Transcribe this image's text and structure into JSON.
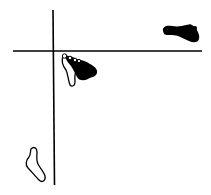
{
  "diagram": {
    "type": "footprints-at-crossroads",
    "lines": [
      {
        "name": "vertical-line",
        "x1": 53,
        "y1": 10,
        "x2": 54,
        "y2": 185
      },
      {
        "name": "horizontal-line",
        "x1": 13,
        "y1": 51,
        "x2": 202,
        "y2": 51
      }
    ],
    "footprints": [
      {
        "name": "filled-footprint-top-right",
        "style": "filled",
        "direction": "right"
      },
      {
        "name": "half-filled-footprint-center",
        "style": "half-filled",
        "direction": "down-right"
      },
      {
        "name": "outline-footprint-bottom-left",
        "style": "outline",
        "direction": "up"
      }
    ],
    "colors": {
      "ink": "#000000",
      "background": "#ffffff"
    }
  }
}
